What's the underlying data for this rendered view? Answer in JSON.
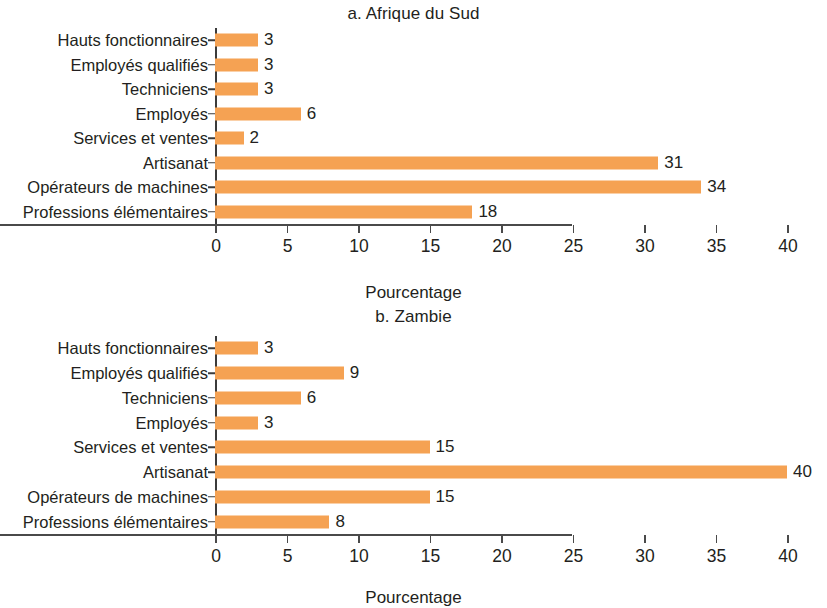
{
  "figure": {
    "background": "#ffffff",
    "bar_color": "#f5a253",
    "text_color": "#231f20",
    "axis_color": "#4a4a4a"
  },
  "panels": [
    {
      "key": "a",
      "title": "a. Afrique du Sud",
      "axis_title": "Pourcentage"
    },
    {
      "key": "b",
      "title": "b. Zambie",
      "axis_title": "Pourcentage"
    }
  ],
  "chart_data": [
    {
      "type": "bar",
      "orientation": "horizontal",
      "title": "a. Afrique du Sud",
      "xlabel": "Pourcentage",
      "ylabel": "",
      "xlim": [
        0,
        40
      ],
      "xticks": [
        0,
        5,
        10,
        15,
        20,
        25,
        30,
        35,
        40
      ],
      "xtick_labels": [
        "0",
        "5",
        "10",
        "15",
        "20",
        "25",
        "30",
        "35",
        "40"
      ],
      "grid": false,
      "legend": false,
      "bar_color": "#f5a253",
      "categories": [
        "Hauts fonctionnaires",
        "Employés qualifiés",
        "Techniciens",
        "Employés",
        "Services et ventes",
        "Artisanat",
        "Opérateurs de machines",
        "Professions élémentaires"
      ],
      "values": [
        3,
        3,
        3,
        6,
        2,
        31,
        34,
        18
      ],
      "data_labels": [
        "3",
        "3",
        "3",
        "6",
        "2",
        "31",
        "34",
        "18"
      ]
    },
    {
      "type": "bar",
      "orientation": "horizontal",
      "title": "b. Zambie",
      "xlabel": "Pourcentage",
      "ylabel": "",
      "xlim": [
        0,
        40
      ],
      "xticks": [
        0,
        5,
        10,
        15,
        20,
        25,
        30,
        35,
        40
      ],
      "xtick_labels": [
        "0",
        "5",
        "10",
        "15",
        "20",
        "25",
        "30",
        "35",
        "40"
      ],
      "grid": false,
      "legend": false,
      "bar_color": "#f5a253",
      "categories": [
        "Hauts fonctionnaires",
        "Employés qualifiés",
        "Techniciens",
        "Employés",
        "Services et ventes",
        "Artisanat",
        "Opérateurs de machines",
        "Professions élémentaires"
      ],
      "values": [
        3,
        9,
        6,
        3,
        15,
        40,
        15,
        8
      ],
      "data_labels": [
        "3",
        "9",
        "6",
        "3",
        "15",
        "40",
        "15",
        "8"
      ]
    }
  ]
}
